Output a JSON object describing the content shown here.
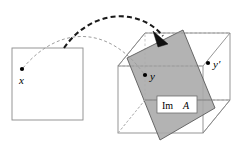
{
  "figure": {
    "background_color": "#ffffff"
  },
  "domain_square": {
    "name": "domain-square",
    "stroke_color": "#8a8a8a",
    "fill_color": "#ffffff",
    "x": 12,
    "y": 48,
    "width": 71,
    "height": 72
  },
  "points": [
    {
      "id": "x",
      "label": "x",
      "label_style": "italic",
      "dot_x": 22,
      "dot_y": 69,
      "label_x": 21,
      "label_y": 82,
      "dot_color": "#000000"
    },
    {
      "id": "y",
      "label": "y",
      "label_style": "italic",
      "dot_x": 145,
      "dot_y": 75,
      "label_x": 150,
      "label_y": 80,
      "dot_color": "#000000"
    },
    {
      "id": "y-prime",
      "label": "y′",
      "label_style": "italic",
      "dot_x": 208,
      "dot_y": 63,
      "label_x": 213,
      "label_y": 68,
      "dot_color": "#000000"
    }
  ],
  "cube": {
    "name": "codomain-cube",
    "stroke_color": "#8a8a8a",
    "hidden_stroke_color": "#b4b4b4",
    "front_face": {
      "x": 118,
      "y": 66,
      "width": 85,
      "height": 67
    },
    "depth_dx": 27,
    "depth_dy": -33
  },
  "image_plane": {
    "name": "image-plane",
    "label": "Im",
    "label_operand": "A",
    "fill_color": "#a8a8a8",
    "stroke_color": "#4a4a4a",
    "opacity": 0.85,
    "corners": [
      {
        "x": 127,
        "y": 58
      },
      {
        "x": 183,
        "y": 30
      },
      {
        "x": 215,
        "y": 108
      },
      {
        "x": 160,
        "y": 140
      }
    ],
    "label_box": {
      "x": 157,
      "y": 97,
      "width": 40,
      "height": 17,
      "fill": "#ffffff",
      "stroke": "#6e6e6e"
    },
    "label_text_x": 161,
    "label_text_y": 109
  },
  "arrows": {
    "primary": {
      "name": "map-arrow-to-image",
      "description": "thick dashed arc from domain to image plane",
      "color": "#1a1a1a",
      "stroke_width": 2.1,
      "dash": "5,3.2",
      "path": "M 64 48 C 92 8, 140 8, 165 38",
      "arrowhead_points": "165,39 153,32 159,46",
      "arrowhead_color": "#111111"
    },
    "secondary": {
      "name": "map-arrow-to-y",
      "description": "thin dashed arc from point x to point y",
      "color": "#9a9a9a",
      "stroke_width": 1.0,
      "dash": "3,2.4",
      "path": "M 23 68 C 58 26, 108 24, 144 74",
      "arrowhead_points": "145,75 137,66 141,70",
      "arrowhead_color": "#8a8a8a"
    }
  }
}
